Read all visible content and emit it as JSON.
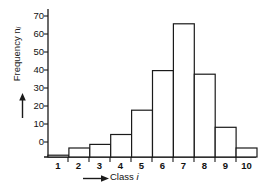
{
  "chart_data": {
    "type": "bar",
    "title": "",
    "subtitle": "",
    "xlabel": "Class i",
    "ylabel": "Frequency nᵢ",
    "categories": [
      "1",
      "2",
      "3",
      "4",
      "5",
      "6",
      "7",
      "8",
      "9",
      "10"
    ],
    "values": [
      1,
      5,
      7,
      12.5,
      26,
      48,
      74,
      46,
      16.5,
      5
    ],
    "series": [
      {
        "name": "Frequency",
        "values": [
          1,
          5,
          7,
          12.5,
          26,
          48,
          74,
          46,
          16.5,
          5
        ]
      }
    ],
    "ylim": [
      0,
      78
    ],
    "xlim": [
      0.5,
      10.5
    ],
    "yticks": [
      0,
      10,
      20,
      30,
      40,
      50,
      60,
      70
    ],
    "ytick_labels": [
      "0",
      "10",
      "20",
      "30",
      "40",
      "50",
      "60",
      "70"
    ],
    "xtick_labels": [
      "1",
      "2",
      "3",
      "4",
      "5",
      "6",
      "7",
      "8",
      "9",
      "10"
    ],
    "grid": false,
    "legend": null,
    "legend_position": "none",
    "bar_fill": "#ffffff",
    "bar_edge": "#1a1a1a",
    "axis_color": "#1a1a1a",
    "text_color": "#111111",
    "background": "#ffffff",
    "annotations": []
  },
  "axes": {
    "y_axis_label_main": "Frequency n",
    "y_axis_label_sub": "i",
    "y_axis_arrow": "up-arrow",
    "x_axis_label": "Class",
    "x_axis_label_italic": "i",
    "x_axis_arrow": "right-arrow"
  }
}
